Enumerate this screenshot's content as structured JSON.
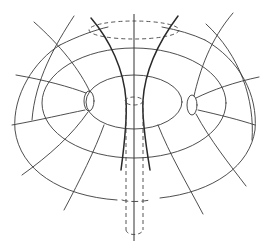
{
  "figure": {
    "colors": {
      "background": "#ffffff",
      "line": "#3a3a3a",
      "bold_line": "#2a2a2a",
      "dashed_line": "#444444"
    },
    "elements": {
      "central_axis": "vertical axis",
      "top_ellipse": "dashed top ellipse",
      "tube": "dashed vertical tube",
      "bottom_ellipse": "dashed bottom cap",
      "throat": "hyperbolic throat curves",
      "nested_surfaces": "concentric elliptical contours",
      "small_loops": "left and right small loops",
      "radial_lines": "radial field lines"
    }
  }
}
